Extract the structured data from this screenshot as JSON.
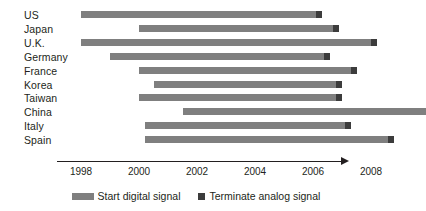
{
  "chart_data": {
    "type": "bar",
    "chart_subtype": "gantt-timeline",
    "title": "",
    "xlabel": "",
    "ylabel": "",
    "xlim": [
      1997.2,
      1997.2
    ],
    "x_axis_start_year": 1998,
    "x_axis_end_year": 2008,
    "tick_labels": [
      "1998",
      "2000",
      "2002",
      "2004",
      "2006",
      "2008"
    ],
    "tick_values": [
      1998,
      2000,
      2002,
      2004,
      2006,
      2008
    ],
    "grid": false,
    "axis_has_arrow": true,
    "legend_position": "bottom-center",
    "categories": [
      "US",
      "Japan",
      "U.K.",
      "Germany",
      "France",
      "Korea",
      "Taiwan",
      "China",
      "Italy",
      "Spain"
    ],
    "series": [
      {
        "name": "Start digital signal",
        "color": "#7f7f7f",
        "marker": "bar",
        "start_values": [
          1998.0,
          2000.0,
          1998.0,
          1999.0,
          2000.0,
          2000.5,
          2000.0,
          2001.5,
          2000.2,
          2000.2
        ]
      },
      {
        "name": "Terminate analog signal",
        "color": "#3c3c3c",
        "marker": "square",
        "end_values": [
          2006.3,
          2006.9,
          2008.2,
          2006.6,
          2007.5,
          2007.0,
          2007.0,
          null,
          2007.3,
          2008.8
        ]
      }
    ],
    "bars": [
      {
        "category": "US",
        "start": 1998.0,
        "end": 2006.3,
        "has_terminator": true
      },
      {
        "category": "Japan",
        "start": 2000.0,
        "end": 2006.9,
        "has_terminator": true
      },
      {
        "category": "U.K.",
        "start": 1998.0,
        "end": 2008.2,
        "has_terminator": true
      },
      {
        "category": "Germany",
        "start": 1999.0,
        "end": 2006.6,
        "has_terminator": true
      },
      {
        "category": "France",
        "start": 2000.0,
        "end": 2007.5,
        "has_terminator": true
      },
      {
        "category": "Korea",
        "start": 2000.5,
        "end": 2007.0,
        "has_terminator": true
      },
      {
        "category": "Taiwan",
        "start": 2000.0,
        "end": 2007.0,
        "has_terminator": true
      },
      {
        "category": "China",
        "start": 2001.5,
        "end": 2009.9,
        "has_terminator": false
      },
      {
        "category": "Italy",
        "start": 2000.2,
        "end": 2007.3,
        "has_terminator": true
      },
      {
        "category": "Spain",
        "start": 2000.2,
        "end": 2008.8,
        "has_terminator": true
      }
    ]
  },
  "legend": {
    "items": [
      {
        "label": "Start digital signal",
        "swatch": "bar",
        "color": "#7f7f7f"
      },
      {
        "label": "Terminate analog signal",
        "swatch": "square",
        "color": "#3c3c3c"
      }
    ]
  },
  "colors": {
    "bar": "#7f7f7f",
    "terminator": "#3c3c3c",
    "axis": "#231f20",
    "text": "#231f20",
    "background": "#ffffff"
  }
}
